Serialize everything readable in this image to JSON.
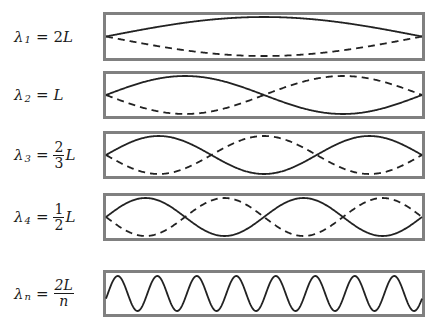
{
  "diagram": {
    "colors": {
      "border": "#808080",
      "curve": "#222222",
      "background": "#ffffff"
    },
    "rows": [
      {
        "id": "h1",
        "symbol": "λ",
        "subscript": "1",
        "equals": "=",
        "value_text": "2L",
        "fraction": null,
        "n": 1,
        "dashed": true,
        "panel": {
          "top": 12,
          "height": 49
        }
      },
      {
        "id": "h2",
        "symbol": "λ",
        "subscript": "2",
        "equals": "=",
        "value_text": "L",
        "fraction": null,
        "n": 2,
        "dashed": true,
        "panel": {
          "top": 71,
          "height": 48
        }
      },
      {
        "id": "h3",
        "symbol": "λ",
        "subscript": "3",
        "equals": "=",
        "value_text": "L",
        "fraction": {
          "num": "2",
          "den": "3"
        },
        "n": 3,
        "dashed": true,
        "panel": {
          "top": 131,
          "height": 48
        }
      },
      {
        "id": "h4",
        "symbol": "λ",
        "subscript": "4",
        "equals": "=",
        "value_text": "L",
        "fraction": {
          "num": "1",
          "den": "2"
        },
        "n": 4,
        "dashed": true,
        "panel": {
          "top": 193,
          "height": 48
        }
      },
      {
        "id": "hn",
        "symbol": "λ",
        "subscript": "n",
        "equals": "=",
        "value_text": "",
        "fraction": {
          "num": "2L",
          "den": "n"
        },
        "n": 16,
        "dashed": false,
        "traveling": true,
        "periods": 8,
        "panel": {
          "top": 270,
          "height": 47
        }
      }
    ]
  }
}
